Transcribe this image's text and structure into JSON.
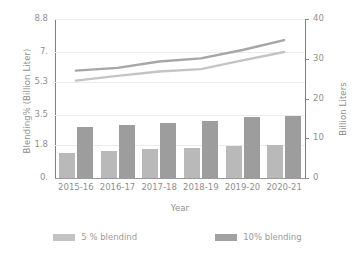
{
  "chart_data": {
    "type": "bar",
    "title": "",
    "xlabel": "Year",
    "ylabel": "Blending% (Billion Liter)",
    "y2label": "Billion Liters",
    "categories": [
      "2015-16",
      "2016-17",
      "2017-18",
      "2018-19",
      "2019-20",
      "2020-21"
    ],
    "ylim": [
      0,
      8.8
    ],
    "yticks": [
      "0.",
      "1.8",
      "3.5",
      "5.3",
      "7.",
      "8.8"
    ],
    "ytick_values": [
      0,
      1.8,
      3.5,
      5.3,
      7.0,
      8.8
    ],
    "y2lim": [
      0,
      40
    ],
    "y2ticks": [
      "0",
      "10",
      "20",
      "30",
      "40"
    ],
    "y2tick_values": [
      0,
      10,
      20,
      30,
      40
    ],
    "grid": true,
    "legend_position": "bottom",
    "series": [
      {
        "name": "5 % blendind",
        "type": "bar",
        "axis": "left",
        "color": "#b9b9b9",
        "values": [
          1.4,
          1.5,
          1.58,
          1.68,
          1.78,
          1.82
        ]
      },
      {
        "name": "10% blending",
        "type": "bar",
        "axis": "left",
        "color": "#9d9d9d",
        "values": [
          2.82,
          2.92,
          3.05,
          3.18,
          3.36,
          3.45
        ]
      },
      {
        "name": "line-upper",
        "type": "line",
        "axis": "right",
        "color": "#a6a6a6",
        "values": [
          27.0,
          27.7,
          29.3,
          30.1,
          32.2,
          34.7
        ]
      },
      {
        "name": "line-lower",
        "type": "line",
        "axis": "right",
        "color": "#c4c4c4",
        "values": [
          24.5,
          25.7,
          26.8,
          27.4,
          29.6,
          31.7
        ]
      }
    ]
  },
  "legend": [
    {
      "label": "5 % blendind",
      "swatch": "s5"
    },
    {
      "label": "10% blending",
      "swatch": "s10"
    }
  ]
}
